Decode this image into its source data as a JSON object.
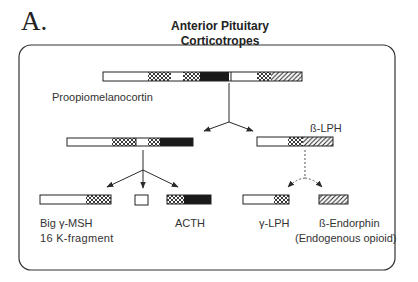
{
  "figure": {
    "panel_letter": "A.",
    "title_line1": "Anterior Pituitary",
    "title_line2": "Corticotropes"
  },
  "nodes": {
    "pomc": {
      "label": "Proopiomelanocortin"
    },
    "intermediate": {
      "label": ""
    },
    "beta_lph": {
      "label": "ß-LPH"
    },
    "big_gamma_msh": {
      "label_line1": "Big γ-MSH",
      "label_line2": "16 K-fragment"
    },
    "small_fragment": {
      "label": ""
    },
    "acth": {
      "label": "ACTH"
    },
    "gamma_lph": {
      "label": "γ-LPH"
    },
    "beta_endorphin": {
      "label_line1": "ß-Endorphin",
      "label_line2": "(Endogenous opioid)"
    }
  },
  "legend_patterns": {
    "white": "unshaded segment",
    "crosshatch": "cross-hatched segment",
    "black": "solid black segment",
    "diagonal": "diagonal-hatched segment"
  },
  "edges": [
    {
      "from": "pomc",
      "to": "intermediate",
      "style": "solid"
    },
    {
      "from": "pomc",
      "to": "beta_lph",
      "style": "solid"
    },
    {
      "from": "intermediate",
      "to": "big_gamma_msh",
      "style": "solid"
    },
    {
      "from": "intermediate",
      "to": "small_fragment",
      "style": "solid"
    },
    {
      "from": "intermediate",
      "to": "acth",
      "style": "solid"
    },
    {
      "from": "beta_lph",
      "to": "gamma_lph",
      "style": "dashed"
    },
    {
      "from": "beta_lph",
      "to": "beta_endorphin",
      "style": "dashed"
    }
  ],
  "colors": {
    "ink": "#2a2a2a",
    "black_fill": "#1a1a1a",
    "background": "#ffffff"
  }
}
